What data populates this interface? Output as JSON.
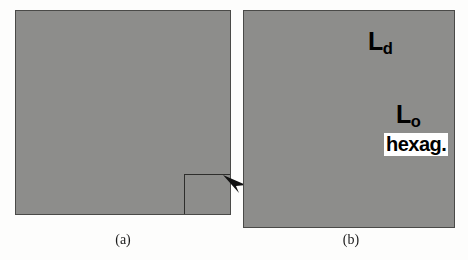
{
  "figure": {
    "type": "simulation-snapshot",
    "background_color": "#fdfdfc",
    "panels": [
      {
        "id": "a",
        "caption": "(a)",
        "description": "Full simulation box, fine-grained hexagonal lattice of lipid particles",
        "border_color": "#4a4a48",
        "background_color": "#8d8d8b",
        "x": 15,
        "y": 10,
        "width": 216,
        "height": 205,
        "lattice": {
          "spacing": 2.6,
          "radius": 1.15,
          "rows": 80,
          "cols": 84
        },
        "selection": {
          "name": "zoom-region",
          "x": 168,
          "y": 163,
          "width": 60,
          "height": 50,
          "border_color": "#2e2e2c"
        }
      },
      {
        "id": "b",
        "caption": "(b)",
        "description": "Magnified view of the boxed region showing Ld, Lo and hexagonal phases",
        "border_color": "#4a4a48",
        "background_color": "#8d8d8b",
        "x": 243,
        "y": 10,
        "width": 212,
        "height": 218,
        "lattice": {
          "spacing": 9.4,
          "radius": 4.3,
          "rows": 24,
          "cols": 24
        }
      }
    ],
    "arrow": {
      "name": "zoom-arrow",
      "from_panel": "a",
      "to_panel": "b",
      "color": "#111111",
      "x": 222,
      "y": 173,
      "width": 26,
      "height": 22
    },
    "labels": [
      {
        "id": "ld",
        "base": "L",
        "subscript": "d",
        "text": "Ld",
        "meaning": "liquid-disordered phase",
        "x": 368,
        "y": 29,
        "font_size": 25,
        "color": "#000000",
        "boxed": false
      },
      {
        "id": "lo",
        "base": "L",
        "subscript": "o",
        "text": "Lo",
        "meaning": "liquid-ordered phase",
        "x": 396,
        "y": 102,
        "font_size": 25,
        "color": "#000000",
        "boxed": false
      },
      {
        "id": "hexag",
        "base": "hexag.",
        "subscript": "",
        "text": "hexag.",
        "meaning": "hexagonal / gel phase",
        "x": 384,
        "y": 133,
        "font_size": 20,
        "color": "#000000",
        "boxed": true,
        "box_color": "#ffffff"
      }
    ],
    "particle_palette": {
      "background_gray": "#8d8d8b",
      "medium_gray": "#7b7b79",
      "dark_gray": "#585856",
      "very_dark": "#343432",
      "light_gray": "#a6a6a4",
      "white_highlight": "#fbfbf6"
    }
  }
}
